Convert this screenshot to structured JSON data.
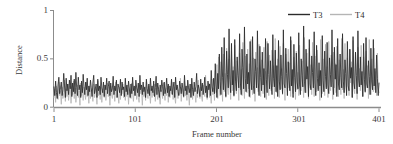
{
  "chart_data": {
    "type": "line",
    "title": "",
    "xlabel": "Frame number",
    "ylabel": "Distance",
    "xlim": [
      1,
      401
    ],
    "ylim": [
      0,
      1
    ],
    "xticks": [
      "1",
      "101",
      "201",
      "301",
      "401"
    ],
    "xtick_values": [
      1,
      101,
      201,
      301,
      401
    ],
    "yticks": [
      "0",
      "0.5",
      "1"
    ],
    "ytick_values": [
      0,
      0.5,
      1
    ],
    "grid": false,
    "legend_position": "top-right",
    "colors": {
      "T3": "#2b2b2b",
      "T4": "#b5b5b5",
      "axis": "#8c8c8c",
      "text": "#3a3a3a",
      "background": "#ffffff"
    },
    "series": [
      {
        "name": "T3",
        "color": "#2b2b2b",
        "values": [
          0.21,
          0.12,
          0.27,
          0.15,
          0.09,
          0.23,
          0.31,
          0.14,
          0.2,
          0.26,
          0.12,
          0.18,
          0.35,
          0.22,
          0.1,
          0.3,
          0.17,
          0.24,
          0.13,
          0.28,
          0.19,
          0.33,
          0.11,
          0.25,
          0.16,
          0.29,
          0.14,
          0.36,
          0.2,
          0.12,
          0.31,
          0.18,
          0.23,
          0.1,
          0.27,
          0.15,
          0.34,
          0.21,
          0.13,
          0.26,
          0.18,
          0.3,
          0.12,
          0.22,
          0.16,
          0.28,
          0.2,
          0.11,
          0.25,
          0.33,
          0.14,
          0.19,
          0.24,
          0.1,
          0.29,
          0.17,
          0.22,
          0.13,
          0.31,
          0.2,
          0.15,
          0.26,
          0.11,
          0.23,
          0.18,
          0.3,
          0.14,
          0.21,
          0.27,
          0.12,
          0.25,
          0.16,
          0.19,
          0.32,
          0.13,
          0.22,
          0.17,
          0.28,
          0.1,
          0.24,
          0.2,
          0.15,
          0.29,
          0.12,
          0.26,
          0.18,
          0.21,
          0.11,
          0.3,
          0.16,
          0.23,
          0.13,
          0.27,
          0.19,
          0.1,
          0.24,
          0.14,
          0.31,
          0.17,
          0.22,
          0.12,
          0.28,
          0.2,
          0.15,
          0.25,
          0.11,
          0.33,
          0.18,
          0.23,
          0.13,
          0.26,
          0.16,
          0.21,
          0.1,
          0.29,
          0.19,
          0.14,
          0.24,
          0.12,
          0.3,
          0.17,
          0.22,
          0.15,
          0.27,
          0.11,
          0.2,
          0.32,
          0.13,
          0.25,
          0.18,
          0.1,
          0.23,
          0.16,
          0.28,
          0.21,
          0.12,
          0.26,
          0.14,
          0.19,
          0.3,
          0.15,
          0.24,
          0.11,
          0.22,
          0.17,
          0.29,
          0.13,
          0.2,
          0.26,
          0.1,
          0.31,
          0.18,
          0.23,
          0.16,
          0.12,
          0.27,
          0.21,
          0.14,
          0.25,
          0.19,
          0.11,
          0.33,
          0.17,
          0.22,
          0.13,
          0.28,
          0.2,
          0.15,
          0.24,
          0.1,
          0.3,
          0.18,
          0.12,
          0.26,
          0.16,
          0.21,
          0.35,
          0.14,
          0.23,
          0.19,
          0.11,
          0.29,
          0.17,
          0.25,
          0.13,
          0.2,
          0.31,
          0.15,
          0.22,
          0.1,
          0.27,
          0.18,
          0.24,
          0.12,
          0.38,
          0.21,
          0.16,
          0.3,
          0.14,
          0.45,
          0.23,
          0.1,
          0.35,
          0.19,
          0.55,
          0.27,
          0.13,
          0.62,
          0.31,
          0.18,
          0.72,
          0.25,
          0.11,
          0.58,
          0.34,
          0.2,
          0.81,
          0.29,
          0.15,
          0.66,
          0.23,
          0.38,
          0.12,
          0.7,
          0.27,
          0.17,
          0.52,
          0.33,
          0.2,
          0.76,
          0.25,
          0.13,
          0.6,
          0.41,
          0.19,
          0.83,
          0.3,
          0.16,
          0.55,
          0.24,
          0.36,
          0.11,
          0.68,
          0.28,
          0.18,
          0.73,
          0.22,
          0.14,
          0.5,
          0.37,
          0.2,
          0.79,
          0.26,
          0.12,
          0.63,
          0.31,
          0.17,
          0.57,
          0.23,
          0.4,
          0.1,
          0.71,
          0.29,
          0.15,
          0.66,
          0.34,
          0.19,
          0.48,
          0.25,
          0.13,
          0.75,
          0.3,
          0.21,
          0.59,
          0.16,
          0.43,
          0.11,
          0.69,
          0.27,
          0.18,
          0.54,
          0.32,
          0.14,
          0.8,
          0.24,
          0.2,
          0.61,
          0.35,
          0.12,
          0.47,
          0.28,
          0.17,
          0.73,
          0.22,
          0.39,
          0.1,
          0.65,
          0.31,
          0.16,
          0.56,
          0.26,
          0.19,
          0.77,
          0.23,
          0.13,
          0.5,
          0.33,
          0.21,
          0.84,
          0.27,
          0.15,
          0.6,
          0.29,
          0.42,
          0.11,
          0.7,
          0.24,
          0.18,
          0.53,
          0.36,
          0.2,
          0.78,
          0.25,
          0.12,
          0.64,
          0.3,
          0.17,
          0.46,
          0.22,
          0.38,
          0.1,
          0.74,
          0.28,
          0.16,
          0.58,
          0.32,
          0.19,
          0.67,
          0.23,
          0.14,
          0.51,
          0.34,
          0.21,
          0.8,
          0.26,
          0.13,
          0.62,
          0.29,
          0.44,
          0.11,
          0.71,
          0.24,
          0.18,
          0.55,
          0.31,
          0.2,
          0.76,
          0.27,
          0.15,
          0.49,
          0.35,
          0.12,
          0.68,
          0.22,
          0.17,
          0.6,
          0.3,
          0.41,
          0.1,
          0.73,
          0.25,
          0.19,
          0.57,
          0.33,
          0.14,
          0.79,
          0.28,
          0.21,
          0.52,
          0.23,
          0.37,
          0.11,
          0.66,
          0.29,
          0.16,
          0.72,
          0.24,
          0.2,
          0.48,
          0.32,
          0.13,
          0.61,
          0.26,
          0.18,
          0.7,
          0.22,
          0.4,
          0.15,
          0.54,
          0.3,
          0.12,
          0.25
        ]
      },
      {
        "name": "T4",
        "color": "#b5b5b5",
        "values": [
          0.1,
          0.19,
          0.05,
          0.22,
          0.14,
          0.08,
          0.26,
          0.12,
          0.17,
          0.03,
          0.21,
          0.09,
          0.15,
          0.28,
          0.06,
          0.19,
          0.11,
          0.24,
          0.07,
          0.16,
          0.22,
          0.04,
          0.18,
          0.13,
          0.27,
          0.09,
          0.2,
          0.05,
          0.15,
          0.23,
          0.1,
          0.17,
          0.02,
          0.25,
          0.12,
          0.19,
          0.07,
          0.21,
          0.14,
          0.08,
          0.26,
          0.11,
          0.16,
          0.04,
          0.22,
          0.09,
          0.18,
          0.13,
          0.06,
          0.24,
          0.1,
          0.2,
          0.15,
          0.03,
          0.27,
          0.12,
          0.17,
          0.08,
          0.21,
          0.05,
          0.19,
          0.14,
          0.1,
          0.23,
          0.07,
          0.16,
          0.25,
          0.11,
          0.18,
          0.02,
          0.22,
          0.13,
          0.09,
          0.2,
          0.15,
          0.06,
          0.26,
          0.1,
          0.17,
          0.12,
          0.04,
          0.21,
          0.08,
          0.19,
          0.14,
          0.24,
          0.1,
          0.16,
          0.07,
          0.22,
          0.11,
          0.18,
          0.03,
          0.2,
          0.13,
          0.09,
          0.25,
          0.15,
          0.06,
          0.17,
          0.12,
          0.21,
          0.08,
          0.19,
          0.1,
          0.05,
          0.23,
          0.14,
          0.18,
          0.02,
          0.2,
          0.11,
          0.16,
          0.07,
          0.26,
          0.13,
          0.09,
          0.22,
          0.15,
          0.04,
          0.19,
          0.1,
          0.17,
          0.12,
          0.24,
          0.06,
          0.2,
          0.14,
          0.08,
          0.21,
          0.11,
          0.03,
          0.18,
          0.16,
          0.09,
          0.25,
          0.13,
          0.07,
          0.2,
          0.12,
          0.22,
          0.05,
          0.17,
          0.1,
          0.19,
          0.14,
          0.26,
          0.08,
          0.21,
          0.11,
          0.04,
          0.23,
          0.16,
          0.09,
          0.18,
          0.13,
          0.3,
          0.06,
          0.2,
          0.15,
          0.1,
          0.27,
          0.12,
          0.17,
          0.07,
          0.22,
          0.14,
          0.02,
          0.19,
          0.11,
          0.24,
          0.08,
          0.16,
          0.2,
          0.13,
          0.05,
          0.18,
          0.1,
          0.28,
          0.15,
          0.09,
          0.21,
          0.12,
          0.06,
          0.23,
          0.17,
          0.11,
          0.33,
          0.14,
          0.08,
          0.19,
          0.25,
          0.1,
          0.16,
          0.04,
          0.29,
          0.13,
          0.2,
          0.07,
          0.38,
          0.15,
          0.44,
          0.09,
          0.52,
          0.18,
          0.12,
          0.47,
          0.22,
          0.06,
          0.55,
          0.16,
          0.35,
          0.1,
          0.61,
          0.2,
          0.13,
          0.5,
          0.26,
          0.08,
          0.58,
          0.17,
          0.42,
          0.11,
          0.64,
          0.21,
          0.14,
          0.48,
          0.3,
          0.07,
          0.56,
          0.18,
          0.39,
          0.12,
          0.67,
          0.23,
          0.09,
          0.53,
          0.28,
          0.15,
          0.6,
          0.19,
          0.45,
          0.1,
          0.7,
          0.24,
          0.13,
          0.51,
          0.32,
          0.06,
          0.57,
          0.2,
          0.41,
          0.16,
          0.65,
          0.22,
          0.11,
          0.49,
          0.29,
          0.14,
          0.62,
          0.18,
          0.37,
          0.08,
          0.68,
          0.25,
          0.12,
          0.54,
          0.31,
          0.17,
          0.59,
          0.21,
          0.43,
          0.09,
          0.71,
          0.23,
          0.15,
          0.5,
          0.27,
          0.1,
          0.63,
          0.19,
          0.4,
          0.13,
          0.66,
          0.22,
          0.07,
          0.55,
          0.33,
          0.16,
          0.6,
          0.2,
          0.46,
          0.11,
          0.69,
          0.24,
          0.14,
          0.52,
          0.3,
          0.08,
          0.58,
          0.18,
          0.36,
          0.12,
          0.64,
          0.21,
          0.17,
          0.48,
          0.26,
          0.1,
          0.72,
          0.23,
          0.15,
          0.56,
          0.29,
          0.09,
          0.61,
          0.2,
          0.44,
          0.13,
          0.67,
          0.25,
          0.11,
          0.53,
          0.32,
          0.16,
          0.59,
          0.19,
          0.38,
          0.07,
          0.7,
          0.22,
          0.14,
          0.5,
          0.28,
          0.12,
          0.65,
          0.21,
          0.42,
          0.1,
          0.68,
          0.24,
          0.17,
          0.54,
          0.31,
          0.08,
          0.57,
          0.2,
          0.45,
          0.15,
          0.63,
          0.23,
          0.11,
          0.49,
          0.27,
          0.13,
          0.71,
          0.18,
          0.39,
          0.09,
          0.66,
          0.22,
          0.16,
          0.51,
          0.3,
          0.12,
          0.6,
          0.25,
          0.47,
          0.1,
          0.69,
          0.19,
          0.14,
          0.55,
          0.28,
          0.08,
          0.62,
          0.21,
          0.4,
          0.17,
          0.64,
          0.24,
          0.11,
          0.52,
          0.33,
          0.15,
          0.58,
          0.2,
          0.43,
          0.09,
          0.7,
          0.23,
          0.13,
          0.5,
          0.29,
          0.16,
          0.61,
          0.18,
          0.37,
          0.12,
          0.56,
          0.2,
          0.15
        ]
      }
    ]
  },
  "legend": {
    "items": [
      {
        "label": "T3",
        "color": "#2b2b2b"
      },
      {
        "label": "T4",
        "color": "#b5b5b5"
      }
    ]
  },
  "axes": {
    "y_title": "Distance",
    "x_title": "Frame number"
  }
}
